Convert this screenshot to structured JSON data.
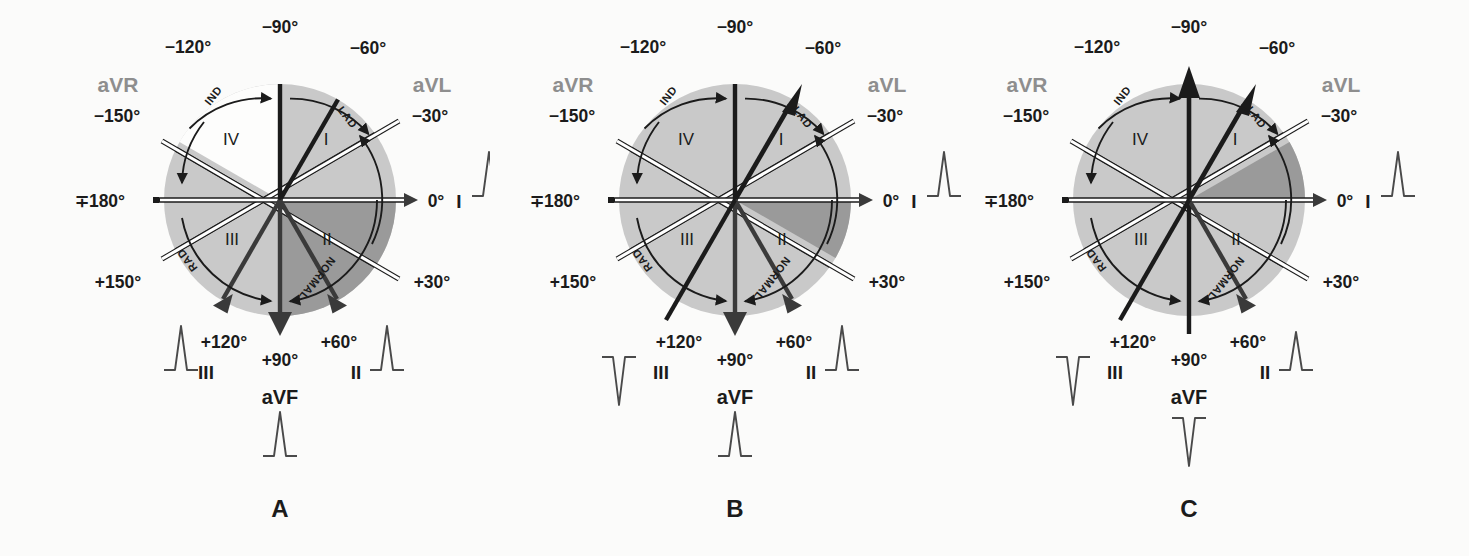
{
  "figure": {
    "colors": {
      "circle_light": "#c9c9c9",
      "circle_dark": "#9a9a9a",
      "circle_white": "#fdfdfc",
      "line_dark": "#1b1b1b",
      "label_gray": "#8e8e8e",
      "background": "#fbfbfa"
    }
  },
  "axis_labels": {
    "neg90": "−90°",
    "neg120": "−120°",
    "neg60": "−60°",
    "neg150": "−150°",
    "neg30": "−30°",
    "pm180": "∓180°",
    "zero": "0°",
    "pos150": "+150°",
    "pos30": "+30°",
    "pos120": "+120°",
    "pos90": "+90°",
    "pos60": "+60°"
  },
  "lead_labels": {
    "aVR": "aVR",
    "aVL": "aVL",
    "aVF": "aVF",
    "I": "I",
    "II": "II",
    "III": "III"
  },
  "quadrant_labels": {
    "q1": "I",
    "q2": "II",
    "q3": "III",
    "q4": "IV"
  },
  "arc_labels": {
    "ind": "IND",
    "lad": "LAD",
    "rad": "RAD",
    "normal": "NORMAL"
  },
  "panels": [
    {
      "id": "A",
      "caption": "A",
      "highlight": {
        "start_deg": 0,
        "end_deg": 90,
        "label": "quadrant-II-normal-right"
      },
      "quadrant4_white": true,
      "bold_vectors": [
        {
          "angle_deg": -90,
          "head": "none"
        },
        {
          "angle_deg": -60,
          "head": "none"
        },
        {
          "angle_deg": 90,
          "head": "solid"
        },
        {
          "angle_deg": 60,
          "head": "solid"
        },
        {
          "angle_deg": 120,
          "head": "solid"
        }
      ],
      "ecg": {
        "I": "positive-tall",
        "II": "positive-tall",
        "III": "positive-tall",
        "aVF": "positive-tall"
      }
    },
    {
      "id": "B",
      "caption": "B",
      "highlight": {
        "start_deg": 0,
        "end_deg": 30,
        "label": "narrow-normal-wedge"
      },
      "quadrant4_white": false,
      "bold_vectors": [
        {
          "angle_deg": -90,
          "head": "none"
        },
        {
          "angle_deg": -60,
          "head": "solid"
        },
        {
          "angle_deg": 90,
          "head": "solid"
        },
        {
          "angle_deg": 60,
          "head": "solid"
        },
        {
          "angle_deg": 120,
          "head": "none"
        }
      ],
      "ecg": {
        "I": "positive-tall",
        "II": "positive-tall",
        "III": "negative-deep",
        "aVF": "positive-tall"
      }
    },
    {
      "id": "C",
      "caption": "C",
      "highlight": {
        "start_deg": -30,
        "end_deg": 0,
        "label": "left-axis-deviation-wedge"
      },
      "quadrant4_white": false,
      "bold_vectors": [
        {
          "angle_deg": -90,
          "head": "solid"
        },
        {
          "angle_deg": -60,
          "head": "solid"
        },
        {
          "angle_deg": 90,
          "head": "none"
        },
        {
          "angle_deg": 60,
          "head": "solid"
        },
        {
          "angle_deg": 120,
          "head": "none"
        }
      ],
      "ecg": {
        "I": "positive-tall",
        "II": "positive-small",
        "III": "negative-deep",
        "aVF": "negative-deep"
      }
    }
  ]
}
